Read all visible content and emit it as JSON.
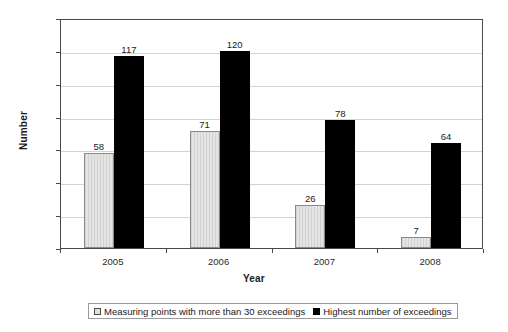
{
  "chart_data": {
    "type": "bar",
    "title": "",
    "xlabel": "Year",
    "ylabel": "Number",
    "categories": [
      "2005",
      "2006",
      "2007",
      "2008"
    ],
    "series": [
      {
        "name": "Measuring points with more than 30 exceedings",
        "values": [
          58,
          71,
          26,
          7
        ],
        "color": "#dcdcdc"
      },
      {
        "name": "Highest number of exceedings",
        "values": [
          117,
          120,
          78,
          64
        ],
        "color": "#000000"
      }
    ],
    "ylim": [
      0,
      140
    ],
    "yticks": [
      0,
      20,
      40,
      60,
      80,
      100,
      120,
      140
    ],
    "grid": "horizontal",
    "legend_position": "bottom",
    "data_labels": true
  },
  "legend": {
    "entries": [
      "Measuring points with more than 30 exceedings",
      "Highest number of exceedings"
    ]
  }
}
